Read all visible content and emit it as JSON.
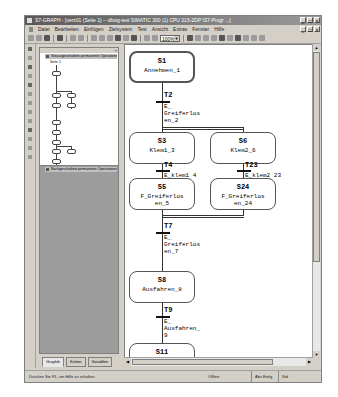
{
  "window": {
    "title": "S7-GRAPH - [verz01 (Seite 1) -- dbsig-test SIMATIC 300 (1) CPU 315-2DP \\S7-Progr ...]",
    "controls": [
      "_",
      "□",
      "×"
    ]
  },
  "menu": [
    "Datei",
    "Bearbeiten",
    "Einfügen",
    "Zielsystem",
    "Test",
    "Ansicht",
    "Extras",
    "Fenster",
    "Hilfe"
  ],
  "toolbar": {
    "zoom": "100%"
  },
  "left_panel": {
    "header": "Vorausgeschaltete permanente Operationen",
    "subnode": "Seite 1",
    "footer": "Nachgeschaltete permanente Operationen",
    "tabs": [
      "Graphik",
      "Ketten",
      "Variablen"
    ],
    "active_tab": 0
  },
  "graph": {
    "steps": [
      {
        "id": "S1",
        "name": "Annehmen_1",
        "initial": true
      },
      {
        "id": "S3",
        "name": "Klem1_3"
      },
      {
        "id": "S6",
        "name": "Klem2_6"
      },
      {
        "id": "S5",
        "name": "F_Greiferlos\nen_5"
      },
      {
        "id": "S24",
        "name": "F_Greiferlos\nen_24"
      },
      {
        "id": "S8",
        "name": "Ausfahren_8"
      },
      {
        "id": "S11",
        "name": "Einfahren_11"
      }
    ],
    "transitions": [
      {
        "id": "T2",
        "cond": "E_\nGreiferlos\nen_2"
      },
      {
        "id": "T4",
        "cond": "E_klem1 4"
      },
      {
        "id": "T23",
        "cond": "E_klem2 23"
      },
      {
        "id": "T7",
        "cond": "E_\nGreiferlos\nen_7"
      },
      {
        "id": "T9",
        "cond": "E_\nAusfahren_\n9"
      },
      {
        "id": "T12",
        "cond": ""
      }
    ]
  },
  "statusbar": {
    "hint": "Drücken Sie F1, um Hilfe zu erhalten.",
    "mode": "Offline",
    "ins": "Abs  Einfg",
    "extra": "Std"
  }
}
